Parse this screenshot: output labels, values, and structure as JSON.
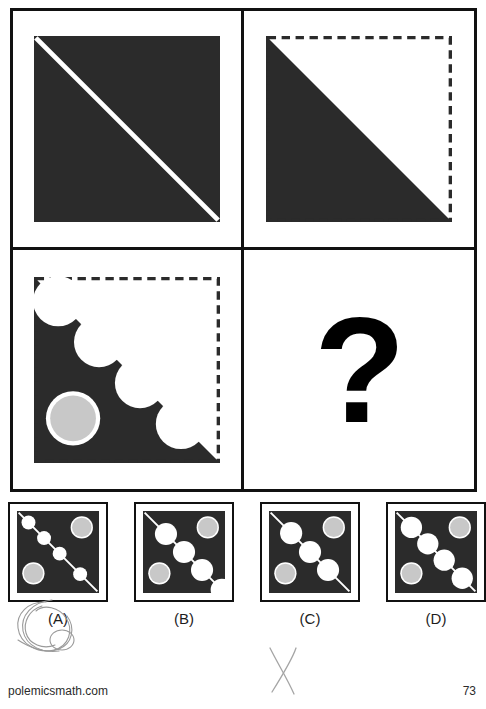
{
  "page": {
    "footer_site": "polemicsmath.com",
    "page_number": "73",
    "colors": {
      "fill_black": "#2b2b2b",
      "fill_gray": "#c8c8c8",
      "fill_white": "#ffffff",
      "border_black": "#111111",
      "pencil": "#9a9a9a"
    }
  },
  "matrix": {
    "rows": 2,
    "cols": 2,
    "cells": [
      {
        "position": "top-left",
        "name": "cell-1",
        "description": "Solid black square with a white diagonal line from top-left to bottom-right",
        "shape": "black-square-with-white-diagonal",
        "border_style": "none",
        "circles_on_diagonal": 0,
        "gray_circles": 0
      },
      {
        "position": "top-right",
        "name": "cell-2",
        "description": "Lower-left black triangle inside a dashed-outline square; diagonal runs top-left to bottom-right",
        "shape": "black-lower-triangle-dashed-square",
        "border_style": "dashed",
        "circles_on_diagonal": 0,
        "gray_circles": 0
      },
      {
        "position": "bottom-left",
        "name": "cell-3",
        "description": "Black lower-left triangle in dashed square, scalloped by four white circles along the diagonal, plus one gray circle in the lower-left region",
        "shape": "black-lower-triangle-scalloped-with-gray-circle",
        "border_style": "dashed",
        "circles_on_diagonal": 4,
        "gray_circles": 1
      },
      {
        "position": "bottom-right",
        "name": "cell-4",
        "description": "Unknown cell marked with a large black question mark",
        "shape": "question-mark",
        "border_style": "none",
        "question_mark": "?"
      }
    ]
  },
  "options": [
    {
      "id": "A",
      "label": "(A)",
      "description": "Black square, thin white diagonal line with four small white circles strung along it; gray circle top-right and gray circle bottom-left",
      "diagonal_line": true,
      "white_circles": 4,
      "white_circle_size": "small",
      "gray_circles": 2,
      "gray_circle_positions": [
        "top-right",
        "bottom-left"
      ],
      "marked_by_user": true
    },
    {
      "id": "B",
      "label": "(B)",
      "description": "Black square with three large white circles along the diagonal and a white notch at the bottom-right corner; gray circle top-right and gray circle bottom-left",
      "diagonal_line": true,
      "white_circles": 3,
      "white_circle_size": "large",
      "corner_notch": "bottom-right",
      "gray_circles": 2,
      "gray_circle_positions": [
        "top-right",
        "bottom-left"
      ],
      "marked_by_user": false
    },
    {
      "id": "C",
      "label": "(C)",
      "description": "Black square with three large white circles along the diagonal and visible line stubs at both diagonal ends; gray circle top-right and gray circle bottom-left",
      "diagonal_line": true,
      "white_circles": 3,
      "white_circle_size": "large",
      "gray_circles": 2,
      "gray_circle_positions": [
        "top-right",
        "bottom-left"
      ],
      "marked_by_user": false
    },
    {
      "id": "D",
      "label": "(D)",
      "description": "Black square with four large white circles along the diagonal; gray circle top-right and gray circle bottom-left",
      "diagonal_line": true,
      "white_circles": 4,
      "white_circle_size": "large",
      "gray_circles": 2,
      "gray_circle_positions": [
        "top-right",
        "bottom-left"
      ],
      "marked_by_user": false
    }
  ],
  "annotations": [
    {
      "name": "pencil-circle-around-option-a",
      "type": "handwritten-circle",
      "target": "(A)"
    },
    {
      "name": "pencil-x-mark",
      "type": "handwritten-x",
      "target": "page-bottom-center"
    }
  ]
}
